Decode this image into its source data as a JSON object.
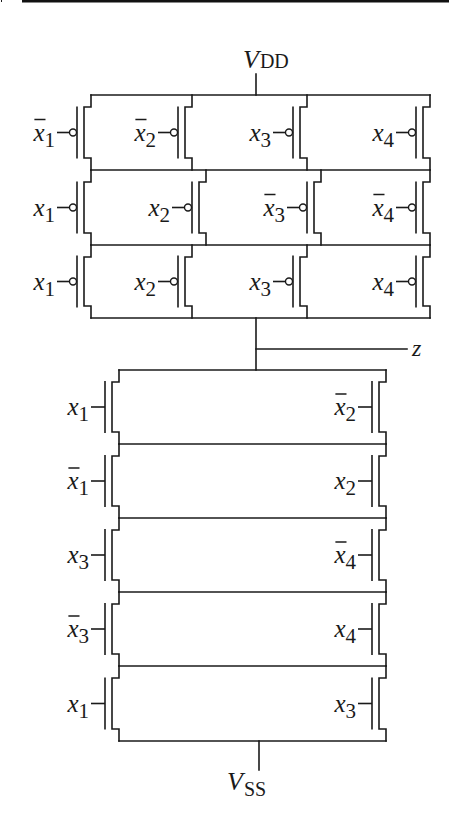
{
  "figure": {
    "type": "CMOS complex gate transistor schematic",
    "supply_top_label": {
      "main": "V",
      "sub": "DD"
    },
    "supply_bottom_label": {
      "main": "V",
      "sub": "SS"
    },
    "output_label": "z",
    "colors": {
      "line": "#1a1a1a",
      "background": "#ffffff",
      "top_rule": "#111111"
    }
  },
  "pull_up_network": {
    "device": "pmos",
    "topology": "3 series stages, each 4 parallel transistors",
    "rows": [
      {
        "row": 1,
        "inputs": [
          {
            "var": "x",
            "sub": "1",
            "bar": true
          },
          {
            "var": "x",
            "sub": "2",
            "bar": true
          },
          {
            "var": "x",
            "sub": "3",
            "bar": false
          },
          {
            "var": "x",
            "sub": "4",
            "bar": false
          }
        ]
      },
      {
        "row": 2,
        "inputs": [
          {
            "var": "x",
            "sub": "1",
            "bar": false
          },
          {
            "var": "x",
            "sub": "2",
            "bar": false
          },
          {
            "var": "x",
            "sub": "3",
            "bar": true
          },
          {
            "var": "x",
            "sub": "4",
            "bar": true
          }
        ]
      },
      {
        "row": 3,
        "inputs": [
          {
            "var": "x",
            "sub": "1",
            "bar": false
          },
          {
            "var": "x",
            "sub": "2",
            "bar": false
          },
          {
            "var": "x",
            "sub": "3",
            "bar": false
          },
          {
            "var": "x",
            "sub": "4",
            "bar": false
          }
        ]
      }
    ]
  },
  "pull_down_network": {
    "device": "nmos",
    "topology": "5 series stages, each 2 parallel transistors",
    "rows": [
      {
        "row": 1,
        "inputs": [
          {
            "var": "x",
            "sub": "1",
            "bar": false
          },
          {
            "var": "x",
            "sub": "2",
            "bar": true
          }
        ]
      },
      {
        "row": 2,
        "inputs": [
          {
            "var": "x",
            "sub": "1",
            "bar": true
          },
          {
            "var": "x",
            "sub": "2",
            "bar": false
          }
        ]
      },
      {
        "row": 3,
        "inputs": [
          {
            "var": "x",
            "sub": "3",
            "bar": false
          },
          {
            "var": "x",
            "sub": "4",
            "bar": true
          }
        ]
      },
      {
        "row": 4,
        "inputs": [
          {
            "var": "x",
            "sub": "3",
            "bar": true
          },
          {
            "var": "x",
            "sub": "4",
            "bar": false
          }
        ]
      },
      {
        "row": 5,
        "inputs": [
          {
            "var": "x",
            "sub": "1",
            "bar": false
          },
          {
            "var": "x",
            "sub": "3",
            "bar": false
          }
        ]
      }
    ]
  }
}
